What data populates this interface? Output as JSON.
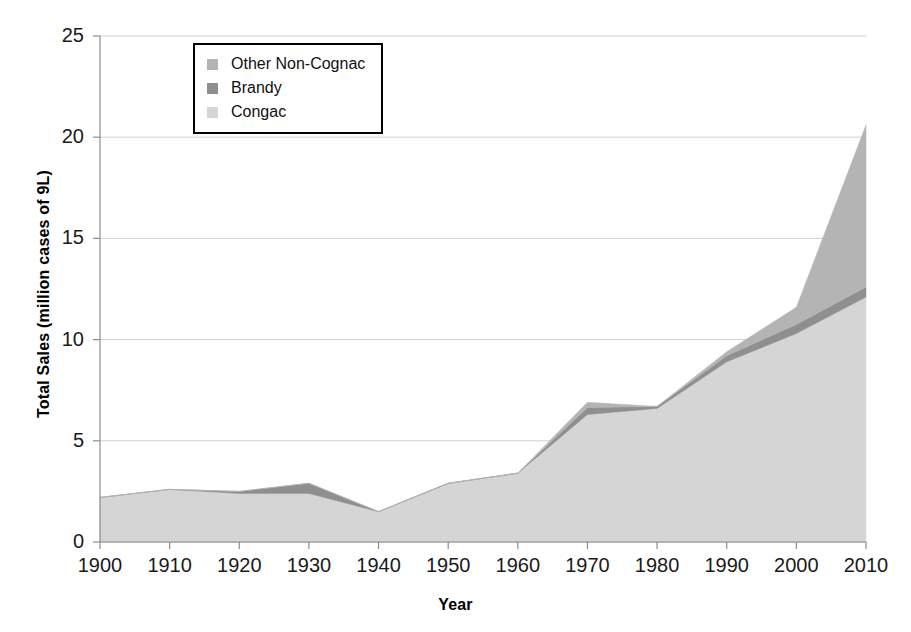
{
  "chart_data": {
    "type": "area",
    "stacked": true,
    "title": "",
    "xlabel": "Year",
    "ylabel": "Total Sales (million cases of 9L)",
    "x": [
      1900,
      1910,
      1920,
      1930,
      1940,
      1950,
      1960,
      1970,
      1980,
      1990,
      2000,
      2010
    ],
    "categories": [
      "1900",
      "1910",
      "1920",
      "1930",
      "1940",
      "1950",
      "1960",
      "1970",
      "1980",
      "1990",
      "2000",
      "2010"
    ],
    "xlim": [
      1900,
      2010
    ],
    "ylim": [
      0,
      25
    ],
    "yticks": [
      0,
      5,
      10,
      15,
      20,
      25
    ],
    "ytick_labels": [
      "0",
      "5",
      "10",
      "15",
      "20",
      "25"
    ],
    "xticks": [
      1900,
      1910,
      1920,
      1930,
      1940,
      1950,
      1960,
      1970,
      1980,
      1990,
      2000,
      2010
    ],
    "xtick_labels": [
      "1900",
      "1910",
      "1920",
      "1930",
      "1940",
      "1950",
      "1960",
      "1970",
      "1980",
      "1990",
      "2000",
      "2010"
    ],
    "grid": "horizontal",
    "legend_position": "upper-left-inside",
    "stack_order_bottom_to_top": [
      "Congac",
      "Brandy",
      "Other Non-Cognac"
    ],
    "series": [
      {
        "name": "Congac",
        "color": "#d5d5d5",
        "values": [
          2.2,
          2.6,
          2.4,
          2.4,
          1.5,
          2.9,
          3.4,
          6.3,
          6.6,
          8.9,
          10.3,
          12.1
        ]
      },
      {
        "name": "Brandy",
        "color": "#8f8f8f",
        "values": [
          0.0,
          0.0,
          0.1,
          0.5,
          0.0,
          0.0,
          0.0,
          0.35,
          0.1,
          0.3,
          0.45,
          0.5
        ]
      },
      {
        "name": "Other Non-Cognac",
        "color": "#b4b4b4",
        "values": [
          0.0,
          0.0,
          0.0,
          0.0,
          0.0,
          0.0,
          0.0,
          0.25,
          0.0,
          0.2,
          0.85,
          8.0
        ]
      }
    ],
    "cumulative_totals": [
      2.2,
      2.6,
      2.5,
      2.9,
      1.5,
      2.9,
      3.4,
      6.9,
      6.7,
      9.4,
      11.6,
      20.6
    ]
  },
  "legend": {
    "items": [
      {
        "label": "Other Non-Cognac",
        "color": "#b4b4b4"
      },
      {
        "label": "Brandy",
        "color": "#8f8f8f"
      },
      {
        "label": "Congac",
        "color": "#d5d5d5"
      }
    ]
  },
  "style": {
    "background": "#ffffff",
    "grid_color": "#cfcfcf",
    "axis_color": "#8c8c8c",
    "text_color": "#000000"
  }
}
